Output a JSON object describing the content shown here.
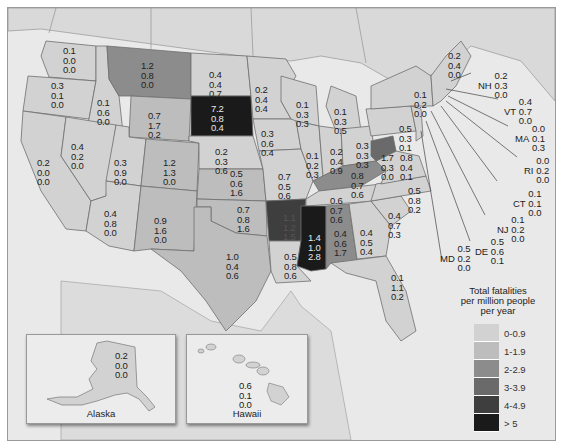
{
  "legend": {
    "title_lines": [
      "Total fatalities",
      "per million people",
      "per year"
    ],
    "bins": [
      {
        "label": "0-0.9",
        "color": "#d2d2d2"
      },
      {
        "label": "1-1.9",
        "color": "#bdbdbd"
      },
      {
        "label": "2-2.9",
        "color": "#8c8c8c"
      },
      {
        "label": "3-3.9",
        "color": "#6a6a6a"
      },
      {
        "label": "4-4.9",
        "color": "#3e3e3e"
      },
      {
        "label": "> 5",
        "color": "#1a1a1a"
      }
    ]
  },
  "states": {
    "WA": {
      "values": [
        "0.1",
        "0.0",
        "0.0"
      ]
    },
    "OR": {
      "values": [
        "0.3",
        "0.1",
        "0.0"
      ]
    },
    "CA": {
      "values": [
        "0.2",
        "0.0",
        "0.0"
      ]
    },
    "ID": {
      "values": [
        "0.1",
        "0.6",
        "0.0"
      ]
    },
    "NV": {
      "values": [
        "0.4",
        "0.2",
        "0.0"
      ]
    },
    "MT": {
      "values": [
        "1.2",
        "0.8",
        "0.0"
      ]
    },
    "WY": {
      "values": [
        "0.7",
        "1.7",
        "0.2"
      ]
    },
    "UT": {
      "values": [
        "0.3",
        "0.9",
        "0.0"
      ]
    },
    "CO": {
      "values": [
        "1.2",
        "1.3",
        "0.0"
      ]
    },
    "AZ": {
      "values": [
        "0.4",
        "0.8",
        "0.0"
      ]
    },
    "NM": {
      "values": [
        "0.9",
        "1.6",
        "0.0"
      ]
    },
    "ND": {
      "values": [
        "0.4",
        "0.4",
        "0.7"
      ]
    },
    "SD": {
      "values": [
        "7.2",
        "0.8",
        "0.4"
      ]
    },
    "NE": {
      "values": [
        "0.2",
        "0.3",
        "0.6"
      ]
    },
    "KS": {
      "values": [
        "0.5",
        "0.6",
        "1.6"
      ]
    },
    "OK": {
      "values": [
        "0.7",
        "0.8",
        "1.6"
      ]
    },
    "TX": {
      "values": [
        "1.0",
        "0.4",
        "0.6"
      ]
    },
    "MN": {
      "values": [
        "0.2",
        "0.4",
        "0.4"
      ]
    },
    "IA": {
      "values": [
        "0.3",
        "0.6",
        "0.4"
      ]
    },
    "MO": {
      "values": [
        "0.7",
        "0.5",
        "0.6"
      ]
    },
    "AR": {
      "values": [
        "1.1",
        "1.2",
        "1.5"
      ]
    },
    "LA": {
      "values": [
        "0.5",
        "0.8",
        "0.6"
      ]
    },
    "WI": {
      "values": [
        "0.1",
        "0.3",
        "0.3"
      ]
    },
    "IL": {
      "values": [
        "0.1",
        "0.2",
        "0.3"
      ]
    },
    "MI": {
      "values": [
        "0.1",
        "0.3",
        "0.5"
      ]
    },
    "IN": {
      "values": [
        "0.2",
        "0.4",
        "0.9"
      ]
    },
    "OH": {
      "values": [
        "0.3",
        "0.3",
        "0.3"
      ]
    },
    "KY": {
      "values": [
        "0.8",
        "0.7",
        "0.6"
      ]
    },
    "TN": {
      "values": [
        "0.6",
        "0.7",
        "0.6"
      ]
    },
    "MS": {
      "values": [
        "1.4",
        "1.0",
        "2.8"
      ]
    },
    "AL": {
      "values": [
        "0.4",
        "0.6",
        "1.7"
      ]
    },
    "GA": {
      "values": [
        "0.4",
        "0.5",
        "0.4"
      ]
    },
    "FL": {
      "values": [
        "0.1",
        "1.1",
        "0.2"
      ]
    },
    "SC": {
      "values": [
        "0.4",
        "0.7",
        "0.3"
      ]
    },
    "NC": {
      "values": [
        "0.5",
        "0.8",
        "0.2"
      ]
    },
    "VA": {
      "values": [
        "0.8",
        "0.4",
        "0.1"
      ]
    },
    "WV": {
      "values": [
        "1.7",
        "0.3",
        "0.0"
      ]
    },
    "PA": {
      "values": [
        "0.5",
        "0.3",
        "0.1"
      ]
    },
    "NY": {
      "values": [
        "0.1",
        "0.2",
        "0.0"
      ]
    },
    "ME": {
      "values": [
        "0.2",
        "0.4",
        "0.0"
      ]
    },
    "NH": {
      "label": "NH",
      "values": [
        "0.2",
        "0.3",
        "0.0"
      ]
    },
    "VT": {
      "label": "VT",
      "values": [
        "0.4",
        "0.7",
        "0.0"
      ]
    },
    "MA": {
      "label": "MA",
      "values": [
        "0.0",
        "0.1",
        "0.3"
      ]
    },
    "RI": {
      "label": "RI",
      "values": [
        "0.0",
        "0.2",
        "0.0"
      ]
    },
    "CT": {
      "label": "CT",
      "values": [
        "0.1",
        "0.1",
        "0.0"
      ]
    },
    "NJ": {
      "label": "NJ",
      "values": [
        "0.1",
        "0.2",
        "0.0"
      ]
    },
    "DE": {
      "label": "DE",
      "values": [
        "0.5",
        "0.6",
        "0.1"
      ]
    },
    "MD": {
      "label": "MD",
      "values": [
        "0.5",
        "0.2",
        "0.0"
      ]
    },
    "AK": {
      "values": [
        "0.2",
        "0.0",
        "0.0"
      ]
    },
    "HI": {
      "values": [
        "0.6",
        "0.1",
        "0.0"
      ]
    }
  },
  "insets": {
    "alaska": {
      "name": "Alaska"
    },
    "hawaii": {
      "name": "Hawaii"
    }
  }
}
